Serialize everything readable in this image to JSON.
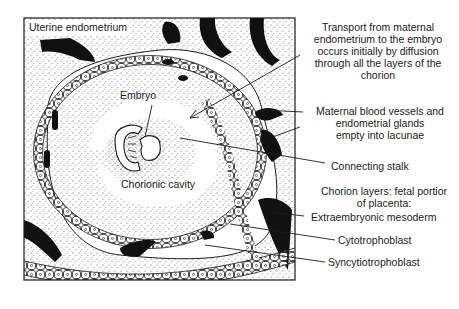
{
  "figure": {
    "title_label": "Uterine endometrium",
    "inner_labels": {
      "embryo": "Embryo",
      "chorionic_cavity": "Chorionic cavity"
    },
    "callouts": [
      {
        "id": "transport",
        "lines": [
          "Transport from maternal",
          "endometrium to the embryo",
          "occurs initially by diffusion",
          "through all the layers of the",
          "chorion"
        ]
      },
      {
        "id": "maternal-vessels",
        "lines": [
          "Maternal blood vessels and",
          "endometrial glands",
          "empty into lacunae"
        ]
      },
      {
        "id": "connecting-stalk",
        "lines": [
          "Connecting stalk"
        ]
      },
      {
        "id": "chorion-layers-heading",
        "lines": [
          "Chorion layers: fetal portior",
          "of placenta:"
        ]
      },
      {
        "id": "extraembryonic-mesoderm",
        "lines": [
          "Extraembryonic mesoderm"
        ]
      },
      {
        "id": "cytotrophoblast",
        "lines": [
          "Cytotrophoblast"
        ]
      },
      {
        "id": "syncytiotrophoblast",
        "lines": [
          "Syncytiotrophoblast"
        ]
      }
    ]
  },
  "colors": {
    "ink": "#1a1a1a",
    "paper": "#ffffff",
    "stipple": "#8a8a8a"
  }
}
